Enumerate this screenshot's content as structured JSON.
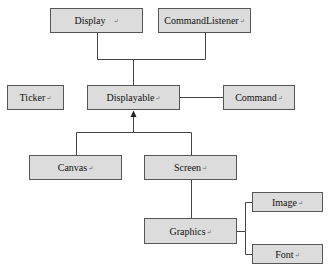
{
  "diagram": {
    "type": "class-hierarchy",
    "colors": {
      "box_fill": "#dcdcdc",
      "box_border": "#555555",
      "line": "#444444",
      "text": "#111111"
    },
    "paragraph_mark": "↵",
    "nodes": [
      {
        "id": "display",
        "label": "Display",
        "x": 50,
        "y": 8,
        "w": 93,
        "h": 25
      },
      {
        "id": "commandlistener",
        "label": "CommandListener",
        "x": 158,
        "y": 8,
        "w": 93,
        "h": 25
      },
      {
        "id": "ticker",
        "label": "Ticker",
        "x": 7,
        "y": 85,
        "w": 57,
        "h": 25
      },
      {
        "id": "displayable",
        "label": "Displayable",
        "x": 87,
        "y": 85,
        "w": 93,
        "h": 25
      },
      {
        "id": "command",
        "label": "Command",
        "x": 223,
        "y": 85,
        "w": 72,
        "h": 25
      },
      {
        "id": "canvas",
        "label": "Canvas",
        "x": 29,
        "y": 155,
        "w": 93,
        "h": 25
      },
      {
        "id": "screen",
        "label": "Screen",
        "x": 144,
        "y": 155,
        "w": 93,
        "h": 25
      },
      {
        "id": "image",
        "label": "Image",
        "x": 252,
        "y": 192,
        "w": 71,
        "h": 20
      },
      {
        "id": "graphics",
        "label": "Graphics",
        "x": 144,
        "y": 218,
        "w": 93,
        "h": 26
      },
      {
        "id": "font",
        "label": "Font",
        "x": 252,
        "y": 244,
        "w": 71,
        "h": 20
      }
    ],
    "edges": [
      {
        "from": "display",
        "to": "displayable",
        "style": "line"
      },
      {
        "from": "commandlistener",
        "to": "displayable",
        "style": "line"
      },
      {
        "from": "displayable",
        "to": "command",
        "style": "line"
      },
      {
        "from": "canvas",
        "to": "displayable",
        "style": "arrow"
      },
      {
        "from": "screen",
        "to": "displayable",
        "style": "arrow"
      },
      {
        "from": "screen",
        "to": "graphics",
        "style": "line"
      },
      {
        "from": "graphics",
        "to": "image",
        "style": "line"
      },
      {
        "from": "graphics",
        "to": "font",
        "style": "line"
      }
    ]
  }
}
